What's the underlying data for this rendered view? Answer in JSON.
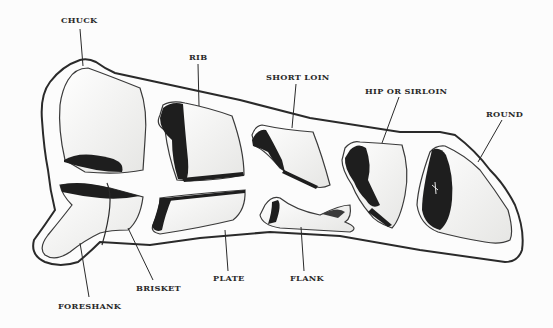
{
  "diagram": {
    "labels": {
      "chuck": "CHUCK",
      "rib": "RIB",
      "short_loin": "SHORT LOIN",
      "hip_or_sirloin": "HIP OR SIRLOIN",
      "round": "ROUND",
      "foreshank": "FORESHANK",
      "brisket": "BRISKET",
      "plate": "PLATE",
      "flank": "FLANK"
    },
    "colors": {
      "ink": "#2a2a2a",
      "meat_dark": "#1e1e1e",
      "fat": "#f4f4f2",
      "background": "#fcfcfc"
    }
  }
}
